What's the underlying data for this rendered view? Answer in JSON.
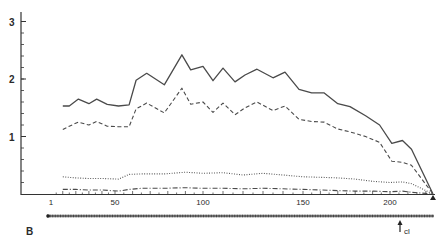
{
  "figure": {
    "panel_label": "B",
    "marker_label": "cl"
  },
  "chart_data": {
    "type": "line",
    "title": "",
    "xlabel": "",
    "ylabel": "",
    "ylim": [
      0,
      3.2
    ],
    "grid": false,
    "legend": "none",
    "y_ticks": [
      {
        "label": "1",
        "value": 1
      },
      {
        "label": "2",
        "value": 2
      },
      {
        "label": "3",
        "value": 3
      }
    ],
    "x_ticks": [
      {
        "label": "1",
        "value": 1
      },
      {
        "label": "50",
        "value": 50
      },
      {
        "label": "100",
        "value": 100
      },
      {
        "label": "150",
        "value": 150
      },
      {
        "label": "200",
        "value": 200
      }
    ],
    "annotations": [
      {
        "text": "B",
        "role": "panel label"
      },
      {
        "text": "cl",
        "role": "arrow marker near position ~215"
      }
    ],
    "series": [
      {
        "name": "solid",
        "style": "solid",
        "x": [
          10,
          15,
          22,
          30,
          36,
          44,
          52,
          58,
          62,
          68,
          78,
          88,
          93,
          100,
          105,
          110,
          116,
          121,
          127,
          135,
          141,
          148,
          155,
          162,
          170,
          177,
          186,
          194,
          201,
          207,
          212,
          224
        ],
        "y": [
          1.53,
          1.53,
          1.65,
          1.57,
          1.65,
          1.56,
          1.53,
          1.55,
          1.98,
          2.1,
          1.9,
          2.42,
          2.16,
          2.22,
          1.97,
          2.19,
          1.95,
          2.07,
          2.17,
          2.02,
          2.12,
          1.82,
          1.76,
          1.76,
          1.57,
          1.52,
          1.36,
          1.2,
          0.88,
          0.93,
          0.78,
          0.0
        ]
      },
      {
        "name": "dashed",
        "style": "dashed",
        "x": [
          10,
          15,
          22,
          30,
          36,
          44,
          52,
          58,
          62,
          68,
          78,
          88,
          93,
          100,
          105,
          110,
          116,
          121,
          127,
          135,
          141,
          148,
          155,
          162,
          170,
          177,
          186,
          194,
          201,
          207,
          212,
          224
        ],
        "y": [
          1.12,
          1.18,
          1.25,
          1.2,
          1.26,
          1.18,
          1.17,
          1.17,
          1.48,
          1.58,
          1.41,
          1.84,
          1.56,
          1.6,
          1.42,
          1.58,
          1.38,
          1.5,
          1.6,
          1.45,
          1.53,
          1.3,
          1.26,
          1.25,
          1.13,
          1.08,
          1.0,
          0.9,
          0.57,
          0.55,
          0.5,
          0.0
        ]
      },
      {
        "name": "dotted",
        "style": "dotted",
        "x": [
          10,
          20,
          30,
          40,
          52,
          58,
          65,
          78,
          90,
          100,
          110,
          120,
          130,
          140,
          150,
          160,
          170,
          180,
          190,
          200,
          207,
          212,
          224
        ],
        "y": [
          0.3,
          0.28,
          0.27,
          0.27,
          0.26,
          0.34,
          0.35,
          0.35,
          0.38,
          0.36,
          0.37,
          0.33,
          0.36,
          0.33,
          0.3,
          0.29,
          0.28,
          0.26,
          0.22,
          0.2,
          0.21,
          0.18,
          0.0
        ]
      },
      {
        "name": "dash-dot",
        "style": "dash-dot",
        "x": [
          10,
          20,
          30,
          40,
          52,
          58,
          65,
          78,
          90,
          100,
          110,
          120,
          130,
          140,
          150,
          160,
          170,
          180,
          190,
          200,
          207,
          212,
          224
        ],
        "y": [
          0.08,
          0.08,
          0.07,
          0.07,
          0.05,
          0.08,
          0.1,
          0.1,
          0.11,
          0.1,
          0.1,
          0.09,
          0.1,
          0.09,
          0.08,
          0.07,
          0.06,
          0.05,
          0.05,
          0.04,
          0.05,
          0.03,
          0.0
        ]
      }
    ]
  }
}
